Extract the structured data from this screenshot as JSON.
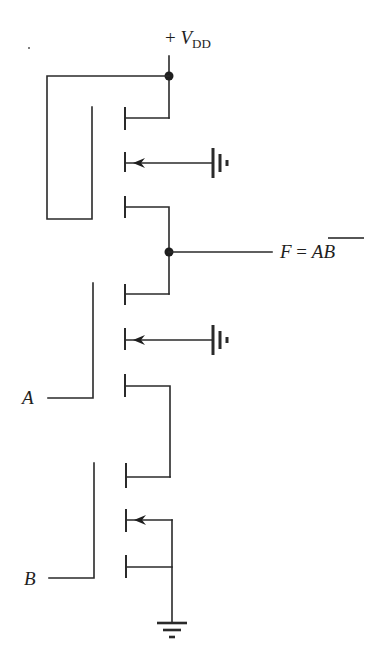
{
  "diagram": {
    "type": "CMOS-style MOSFET NAND gate schematic",
    "supply_label": {
      "prefix": "+ ",
      "symbol": "V",
      "subscript": "DD"
    },
    "output_label": {
      "name": "F",
      "equals": " = ",
      "expression": "AB",
      "overline": true,
      "meaning": "F = NOT(A AND B)"
    },
    "inputs": [
      {
        "label": "A"
      },
      {
        "label": "B"
      }
    ],
    "transistors": [
      {
        "id": "T1",
        "role": "load",
        "gate": "tied to VDD",
        "substrate": "ground"
      },
      {
        "id": "T2",
        "role": "driver",
        "gate": "A",
        "substrate": "ground"
      },
      {
        "id": "T3",
        "role": "driver",
        "gate": "B",
        "substrate": "source"
      }
    ],
    "nodes": [
      "VDD",
      "F",
      "GND"
    ],
    "colors": {
      "ink": "#2a2a2a",
      "background": "#ffffff"
    }
  }
}
